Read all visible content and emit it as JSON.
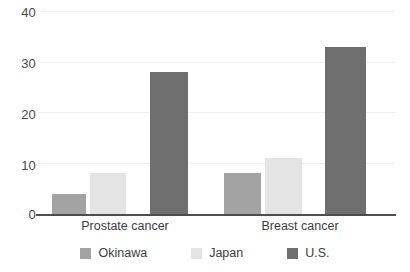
{
  "chart_data": {
    "type": "bar",
    "title": "",
    "subtitle": "",
    "xlabel": "",
    "ylabel": "",
    "categories": [
      "Prostate cancer",
      "Breast cancer"
    ],
    "series": [
      {
        "name": "Okinawa",
        "values": [
          4,
          8
        ],
        "color": "#a3a3a3"
      },
      {
        "name": "Japan",
        "values": [
          8,
          11
        ],
        "color": "#e4e4e4"
      },
      {
        "name": "U.S.",
        "values": [
          28,
          33
        ],
        "color": "#6f6f6f"
      }
    ],
    "ylim": [
      0,
      40
    ],
    "ytick_labels": [
      "0",
      "10",
      "20",
      "30",
      "40"
    ],
    "ytick_values": [
      0,
      10,
      20,
      30,
      40
    ],
    "grid": true,
    "legend_position": "bottom",
    "annotations": []
  },
  "axis": {
    "y_labels": [
      "40",
      "30",
      "20",
      "10",
      "0"
    ]
  },
  "legend": {
    "items": [
      {
        "label": "Okinawa"
      },
      {
        "label": "Japan"
      },
      {
        "label": "U.S."
      }
    ]
  }
}
